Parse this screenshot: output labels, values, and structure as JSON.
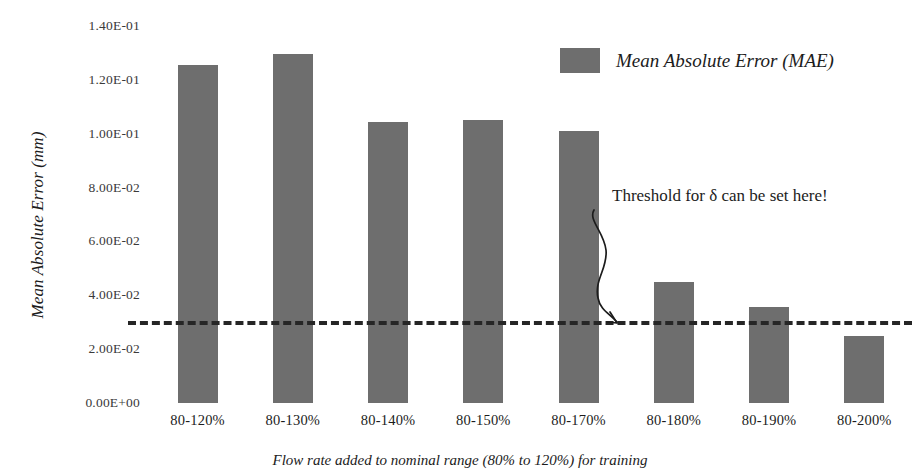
{
  "chart_data": {
    "type": "bar",
    "title": "",
    "xlabel": "",
    "ylabel": "Mean Absolute Error (mm)",
    "categories": [
      "80-120%",
      "80-130%",
      "80-140%",
      "80-150%",
      "80-170%",
      "80-180%",
      "80-190%",
      "80-200%"
    ],
    "values": [
      0.1255,
      0.1295,
      0.1045,
      0.105,
      0.101,
      0.045,
      0.0355,
      0.025
    ],
    "series": [
      {
        "name": "Mean Absolute Error (MAE)",
        "values": [
          0.1255,
          0.1295,
          0.1045,
          0.105,
          0.101,
          0.045,
          0.0355,
          0.025
        ]
      }
    ],
    "ylim": [
      0.0,
      0.14
    ],
    "ytick_values": [
      0.14,
      0.12,
      0.1,
      0.08,
      0.06,
      0.04,
      0.02,
      0.0
    ],
    "ytick_labels": [
      "1.40E-01",
      "1.20E-01",
      "1.00E-01",
      "8.00E-02",
      "6.00E-02",
      "4.00E-02",
      "2.00E-02",
      "0.00E+00"
    ],
    "grid": false,
    "legend_position": "top-right",
    "bar_color": "#6e6e6e",
    "threshold": {
      "value": 0.0305,
      "style": "dashed",
      "color": "#262626"
    },
    "annotations": [
      {
        "text": "Threshold for δ can be set here!",
        "points_to": "threshold-line"
      }
    ]
  },
  "legend": {
    "label": "Mean Absolute Error (MAE)"
  },
  "axes": {
    "y_title": "Mean Absolute Error (mm)"
  },
  "caption": {
    "text": "Flow rate added to nominal range (80% to 120%) for training"
  }
}
